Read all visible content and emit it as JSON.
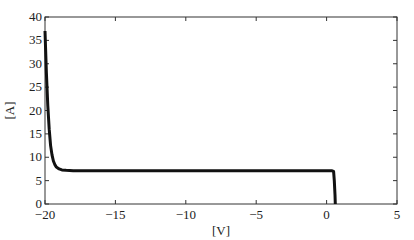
{
  "chart_data": {
    "type": "line",
    "title": "",
    "xlabel": "[V]",
    "ylabel": "[A]",
    "xlim": [
      -20,
      5
    ],
    "ylim": [
      0,
      40
    ],
    "xticks": [
      -20,
      -15,
      -10,
      -5,
      0,
      5
    ],
    "yticks": [
      0,
      5,
      10,
      15,
      20,
      25,
      30,
      35,
      40
    ],
    "xtick_labels": [
      "−20",
      "−15",
      "−10",
      "−5",
      "0",
      "5"
    ],
    "ytick_labels": [
      "0",
      "5",
      "10",
      "15",
      "20",
      "25",
      "30",
      "35",
      "40"
    ],
    "grid": false,
    "legend": null,
    "series": [
      {
        "name": "I-V curve",
        "color": "#111111",
        "x": [
          -20.0,
          -19.9,
          -19.8,
          -19.7,
          -19.6,
          -19.5,
          -19.4,
          -19.3,
          -19.2,
          -19.0,
          -18.8,
          -18.5,
          -18.0,
          -17.0,
          -15.0,
          -10.0,
          -5.0,
          0.0,
          0.4,
          0.5,
          0.55,
          0.6,
          0.62
        ],
        "y": [
          37.0,
          28.0,
          21.0,
          16.0,
          12.5,
          10.5,
          9.2,
          8.4,
          7.9,
          7.5,
          7.3,
          7.2,
          7.1,
          7.1,
          7.1,
          7.1,
          7.1,
          7.1,
          7.1,
          7.0,
          5.0,
          2.0,
          0.0
        ]
      }
    ]
  },
  "plot": {
    "frame": {
      "left": 45,
      "right": 397,
      "top": 17,
      "bottom": 204
    }
  }
}
